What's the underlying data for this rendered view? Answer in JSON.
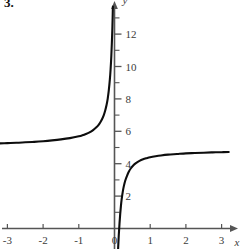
{
  "figure": {
    "problem_number": "3.",
    "x_axis_label": "x",
    "y_axis_label": "y"
  },
  "chart_data": {
    "type": "line",
    "title": "",
    "xlabel": "x",
    "ylabel": "y",
    "grid": false,
    "legend": null,
    "xlim": [
      -3.3,
      3.3
    ],
    "ylim": [
      -1.3,
      14.2
    ],
    "xticks": [
      -3,
      -2,
      -1,
      0,
      1,
      2,
      3
    ],
    "xticklabels": [
      "-3",
      "-2",
      "-1",
      "0",
      "1",
      "2",
      "3"
    ],
    "yticks": [
      2,
      4,
      6,
      8,
      10,
      12
    ],
    "yticklabels": [
      "2",
      "4",
      "6",
      "8",
      "10",
      "12"
    ],
    "yticks_minor": [
      1,
      3,
      5,
      7,
      9,
      11,
      13
    ],
    "vertical_asymptote": 0.15,
    "horizontal_asymptote_left": 5.2,
    "horizontal_asymptote_right": 4.75,
    "x_intercept": 0.17,
    "series": [
      {
        "name": "left-branch",
        "points": [
          [
            -3.25,
            5.25
          ],
          [
            -3.0,
            5.27
          ],
          [
            -2.75,
            5.29
          ],
          [
            -2.5,
            5.32
          ],
          [
            -2.25,
            5.35
          ],
          [
            -2.0,
            5.39
          ],
          [
            -1.75,
            5.44
          ],
          [
            -1.5,
            5.5
          ],
          [
            -1.25,
            5.58
          ],
          [
            -1.0,
            5.69
          ],
          [
            -0.9,
            5.75
          ],
          [
            -0.8,
            5.83
          ],
          [
            -0.7,
            5.93
          ],
          [
            -0.6,
            6.07
          ],
          [
            -0.5,
            6.26
          ],
          [
            -0.45,
            6.38
          ],
          [
            -0.4,
            6.54
          ],
          [
            -0.35,
            6.74
          ],
          [
            -0.3,
            7.0
          ],
          [
            -0.26,
            7.28
          ],
          [
            -0.22,
            7.65
          ],
          [
            -0.19,
            8.02
          ],
          [
            -0.16,
            8.52
          ],
          [
            -0.13,
            9.2
          ],
          [
            -0.11,
            9.8
          ],
          [
            -0.09,
            10.6
          ],
          [
            -0.075,
            11.4
          ],
          [
            -0.062,
            12.2
          ],
          [
            -0.052,
            13.0
          ],
          [
            -0.045,
            13.7
          ]
        ]
      },
      {
        "name": "right-branch",
        "points": [
          [
            0.1,
            -1.3
          ],
          [
            0.12,
            -0.4
          ],
          [
            0.14,
            0.3
          ],
          [
            0.16,
            0.9
          ],
          [
            0.18,
            1.4
          ],
          [
            0.2,
            1.8
          ],
          [
            0.23,
            2.25
          ],
          [
            0.26,
            2.6
          ],
          [
            0.3,
            2.95
          ],
          [
            0.35,
            3.25
          ],
          [
            0.4,
            3.5
          ],
          [
            0.46,
            3.72
          ],
          [
            0.53,
            3.9
          ],
          [
            0.6,
            4.03
          ],
          [
            0.7,
            4.17
          ],
          [
            0.8,
            4.27
          ],
          [
            0.9,
            4.34
          ],
          [
            1.0,
            4.4
          ],
          [
            1.15,
            4.46
          ],
          [
            1.3,
            4.51
          ],
          [
            1.5,
            4.56
          ],
          [
            1.75,
            4.6
          ],
          [
            2.0,
            4.64
          ],
          [
            2.25,
            4.66
          ],
          [
            2.5,
            4.68
          ],
          [
            2.75,
            4.7
          ],
          [
            3.0,
            4.71
          ],
          [
            3.2,
            4.72
          ]
        ]
      }
    ]
  },
  "style": {
    "curve_color": "#0d0d0d",
    "axis_color": "#555555",
    "label_color": "#3b3b3b",
    "background": "#ffffff"
  }
}
